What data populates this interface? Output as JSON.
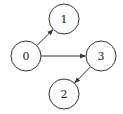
{
  "graph": {
    "directed": true,
    "nodes": [
      {
        "id": "0",
        "label": "0",
        "cx": 26,
        "cy": 56,
        "r": 15
      },
      {
        "id": "1",
        "label": "1",
        "cx": 64,
        "cy": 19,
        "r": 15
      },
      {
        "id": "3",
        "label": "3",
        "cx": 101,
        "cy": 56,
        "r": 15
      },
      {
        "id": "2",
        "label": "2",
        "cx": 64,
        "cy": 94,
        "r": 15
      }
    ],
    "edges": [
      {
        "from": "0",
        "to": "1"
      },
      {
        "from": "0",
        "to": "3"
      },
      {
        "from": "3",
        "to": "2"
      }
    ],
    "colors": {
      "stroke": "#333333",
      "fill": "#ffffff",
      "text": "#222222"
    }
  }
}
